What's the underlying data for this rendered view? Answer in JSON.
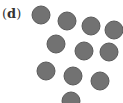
{
  "panel": {
    "label_open": "(",
    "label_letter": "d",
    "label_close": ")"
  },
  "style": {
    "fill": "#727272",
    "stroke": "#5a5a5a",
    "radius": 9
  },
  "circles": [
    {
      "cx": 41,
      "cy": 15
    },
    {
      "cx": 67,
      "cy": 21
    },
    {
      "cx": 91,
      "cy": 26
    },
    {
      "cx": 114,
      "cy": 30
    },
    {
      "cx": 56,
      "cy": 44
    },
    {
      "cx": 84,
      "cy": 51
    },
    {
      "cx": 109,
      "cy": 52
    },
    {
      "cx": 46,
      "cy": 71
    },
    {
      "cx": 73,
      "cy": 76
    },
    {
      "cx": 100,
      "cy": 81
    },
    {
      "cx": 71,
      "cy": 101
    }
  ]
}
